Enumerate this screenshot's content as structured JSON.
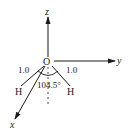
{
  "diagram": {
    "axes": {
      "x": {
        "label": "x"
      },
      "y": {
        "label": "y"
      },
      "z": {
        "label": "z"
      }
    },
    "atoms": {
      "center": {
        "label": "O"
      },
      "left": {
        "label": "H"
      },
      "right": {
        "label": "H"
      }
    },
    "bond_lengths": {
      "left": "1.0",
      "right": "1.0"
    },
    "bond_angle": "104.5°",
    "colors": {
      "stroke": "#1a1a1a",
      "background": "#ffffff"
    }
  }
}
